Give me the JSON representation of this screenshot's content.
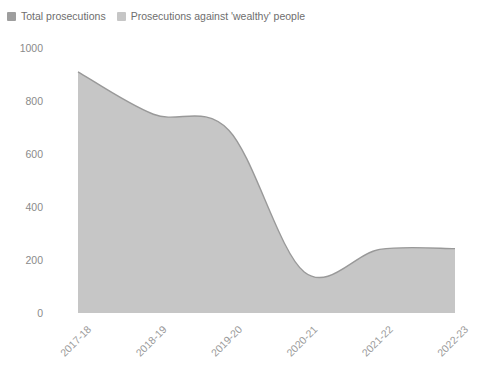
{
  "title_sliver": "",
  "legend": {
    "position": "top-left",
    "items": [
      {
        "label": "Total prosecutions",
        "color": "#9e9e9e",
        "name": "total-prosecutions"
      },
      {
        "label": "Prosecutions against 'wealthy' people",
        "color": "#c6c6c6",
        "name": "wealthy-prosecutions"
      }
    ]
  },
  "colors": {
    "area_fill": "#c6c6c6",
    "area_stroke": "#999999",
    "axis_text": "#8a8a8a",
    "xaxis_text": "#9a9a9a",
    "background": "#ffffff"
  },
  "axis": {
    "y_ticks": [
      "0",
      "200",
      "400",
      "600",
      "800",
      "1000"
    ],
    "x_ticks": [
      "2017-18",
      "2018-19",
      "2019-20",
      "2020-21",
      "2021-22",
      "2022-23"
    ],
    "x_label_rotation": -45
  },
  "chart_data": {
    "type": "area",
    "title": "",
    "subtitle": "",
    "xlabel": "",
    "ylabel": "",
    "categories": [
      "2017-18",
      "2018-19",
      "2019-20",
      "2020-21",
      "2021-22",
      "2022-23"
    ],
    "series": [
      {
        "name": "Total prosecutions",
        "values": [
          910,
          750,
          690,
          155,
          240,
          243
        ]
      },
      {
        "name": "Prosecutions against 'wealthy' people",
        "values": [
          0,
          0,
          0,
          0,
          0,
          0
        ]
      }
    ],
    "ylim": [
      0,
      1000
    ],
    "ytick_step": 200,
    "grid": false,
    "legend_position": "top-left",
    "smoothing": "monotone-spline"
  }
}
